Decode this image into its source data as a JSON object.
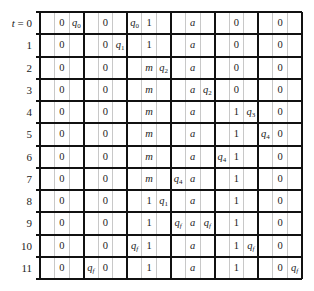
{
  "row_label_prefix": "t = ",
  "row_labels": [
    "0",
    "1",
    "2",
    "3",
    "4",
    "5",
    "6",
    "7",
    "8",
    "9",
    "10",
    "11"
  ],
  "groups": 6,
  "cells_per_group": 3,
  "table": [
    [
      "",
      "0",
      "q0",
      "",
      "0",
      "",
      "q0",
      "1",
      "",
      "",
      "a",
      "",
      "",
      "0",
      "",
      "",
      "0",
      ""
    ],
    [
      "",
      "0",
      "",
      "",
      "0",
      "q1",
      "",
      "1",
      "",
      "",
      "a",
      "",
      "",
      "0",
      "",
      "",
      "0",
      ""
    ],
    [
      "",
      "0",
      "",
      "",
      "0",
      "",
      "",
      "m",
      "q2",
      "",
      "a",
      "",
      "",
      "0",
      "",
      "",
      "0",
      ""
    ],
    [
      "",
      "0",
      "",
      "",
      "0",
      "",
      "",
      "m",
      "",
      "",
      "a",
      "q2",
      "",
      "0",
      "",
      "",
      "0",
      ""
    ],
    [
      "",
      "0",
      "",
      "",
      "0",
      "",
      "",
      "m",
      "",
      "",
      "a",
      "",
      "",
      "1",
      "q3",
      "",
      "0",
      ""
    ],
    [
      "",
      "0",
      "",
      "",
      "0",
      "",
      "",
      "m",
      "",
      "",
      "a",
      "",
      "",
      "1",
      "",
      "q4",
      "0",
      ""
    ],
    [
      "",
      "0",
      "",
      "",
      "0",
      "",
      "",
      "m",
      "",
      "",
      "a",
      "",
      "q4",
      "1",
      "",
      "",
      "0",
      ""
    ],
    [
      "",
      "0",
      "",
      "",
      "0",
      "",
      "",
      "m",
      "",
      "q4",
      "a",
      "",
      "",
      "1",
      "",
      "",
      "0",
      ""
    ],
    [
      "",
      "0",
      "",
      "",
      "0",
      "",
      "",
      "1",
      "q1",
      "",
      "a",
      "",
      "",
      "1",
      "",
      "",
      "0",
      ""
    ],
    [
      "",
      "0",
      "",
      "",
      "0",
      "",
      "",
      "1",
      "",
      "qf",
      "a",
      "qf",
      "",
      "1",
      "",
      "",
      "0",
      ""
    ],
    [
      "",
      "0",
      "",
      "",
      "0",
      "",
      "qf",
      "1",
      "",
      "",
      "a",
      "",
      "",
      "1",
      "qf",
      "",
      "0",
      ""
    ],
    [
      "",
      "0",
      "",
      "qf",
      "0",
      "",
      "",
      "1",
      "",
      "",
      "a",
      "",
      "",
      "1",
      "",
      "",
      "0",
      "qf"
    ]
  ],
  "colors": {
    "thick_line": "#111111",
    "thin_line": "#c8c8c8",
    "text": "#222222"
  }
}
